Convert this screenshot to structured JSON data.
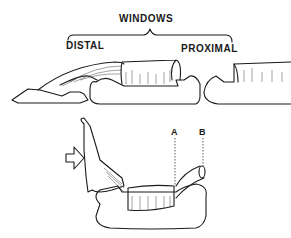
{
  "labels": {
    "windows": "WINDOWS",
    "distal": "DISTAL",
    "proximal": "PROXIMAL",
    "a": "A",
    "b": "B"
  },
  "icons": {
    "arrow": "hollow-right-arrow"
  }
}
